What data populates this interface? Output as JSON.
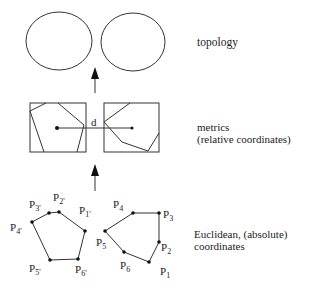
{
  "levels": {
    "topology": {
      "label": "topology"
    },
    "metrics": {
      "label_line1": "metrics",
      "label_line2": "(relative coordinates)",
      "distance_label": "d"
    },
    "euclidean": {
      "label_line1": "Euclidean, (absolute)",
      "label_line2": "coordinates"
    }
  },
  "points_left": [
    {
      "name": "P",
      "sub": "1'"
    },
    {
      "name": "P",
      "sub": "2'"
    },
    {
      "name": "P",
      "sub": "3'"
    },
    {
      "name": "P",
      "sub": "4'"
    },
    {
      "name": "P",
      "sub": "5'"
    },
    {
      "name": "P",
      "sub": "6'"
    }
  ],
  "points_right": [
    {
      "name": "P",
      "sub": "1"
    },
    {
      "name": "P",
      "sub": "2"
    },
    {
      "name": "P",
      "sub": "3"
    },
    {
      "name": "P",
      "sub": "4"
    },
    {
      "name": "P",
      "sub": "5"
    },
    {
      "name": "P",
      "sub": "6"
    }
  ]
}
